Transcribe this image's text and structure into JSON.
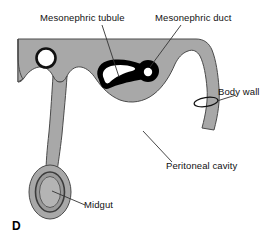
{
  "figure": {
    "panel_letter": "D",
    "type": "anatomical-diagram",
    "background_color": "#ffffff",
    "tissue_fill_color": "#a8a8a8",
    "tissue_outline_color": "#4a4a4a",
    "duct_color": "#000000",
    "lumen_color": "#ffffff",
    "leader_line_color": "#333333",
    "text_color": "#111111"
  },
  "labels": {
    "mesonephric_tubule": "Mesonephric tubule",
    "mesonephric_duct": "Mesonephric duct",
    "body_wall": "Body wall",
    "peritoneal_cavity": "Peritoneal cavity",
    "midgut": "Midgut"
  },
  "structures": [
    {
      "name": "neural-tube",
      "description": "white circle with black ring, upper left of dorsal tissue"
    },
    {
      "name": "mesonephric-tubule",
      "description": "black teardrop ring with white lumen"
    },
    {
      "name": "mesonephric-duct",
      "description": "small black circle with white lumen"
    },
    {
      "name": "body-wall",
      "description": "gray curved strip descending at right"
    },
    {
      "name": "mesentery",
      "description": "gray vertical stalk suspending the gut"
    },
    {
      "name": "midgut",
      "description": "gray bulb with concentric rings at lower left"
    },
    {
      "name": "peritoneal-cavity",
      "description": "open white space below dorsal tissue"
    }
  ]
}
